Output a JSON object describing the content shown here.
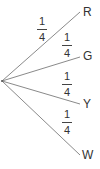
{
  "diagram": {
    "type": "probability-tree",
    "root": {
      "x": 2,
      "y": 81
    },
    "line_color": "#8a8a8a",
    "branches": [
      {
        "outcome": "R",
        "numerator": "1",
        "denominator": "4",
        "end": {
          "x": 80,
          "y": 12
        }
      },
      {
        "outcome": "G",
        "numerator": "1",
        "denominator": "4",
        "end": {
          "x": 80,
          "y": 57
        }
      },
      {
        "outcome": "Y",
        "numerator": "1",
        "denominator": "4",
        "end": {
          "x": 80,
          "y": 104
        }
      },
      {
        "outcome": "W",
        "numerator": "1",
        "denominator": "4",
        "end": {
          "x": 80,
          "y": 155
        }
      }
    ]
  }
}
